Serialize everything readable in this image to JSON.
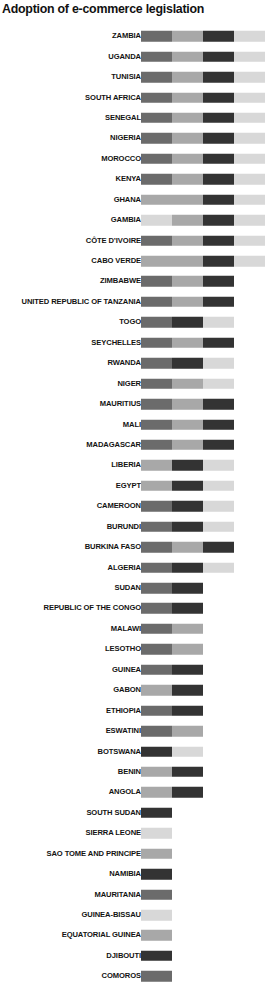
{
  "chart": {
    "title": "Adoption of e-commerce legislation"
  },
  "palette": {
    "dark": "#333333",
    "mid": "#6b6b6b",
    "light": "#a8a8a8",
    "pale": "#d8d8d8"
  },
  "chart_data": {
    "type": "bar",
    "orientation": "horizontal",
    "stacked": true,
    "title": "Adoption of e-commerce legislation",
    "xlabel": "",
    "ylabel": "",
    "grid": false,
    "legend": "none",
    "axis_ticks_visible": false,
    "xlim": [
      0,
      4
    ],
    "segment_unit_px": 31,
    "series": [
      {
        "name": "category-1",
        "color": "#6b6b6b"
      },
      {
        "name": "category-2",
        "color": "#a8a8a8"
      },
      {
        "name": "category-3",
        "color": "#333333"
      },
      {
        "name": "category-4",
        "color": "#d8d8d8"
      }
    ],
    "categories": [
      "ZAMBIA",
      "UGANDA",
      "TUNISIA",
      "SOUTH AFRICA",
      "SENEGAL",
      "NIGERIA",
      "MOROCCO",
      "KENYA",
      "GHANA",
      "GAMBIA",
      "CÔTE D’IVOIRE",
      "CABO VERDE",
      "ZIMBABWE",
      "UNITED REPUBLIC OF TANZANIA",
      "TOGO",
      "SEYCHELLES",
      "RWANDA",
      "NIGER",
      "MAURITIUS",
      "MALI",
      "MADAGASCAR",
      "LIBERIA",
      "EGYPT",
      "CAMEROON",
      "BURUNDI",
      "BURKINA FASO",
      "ALGERIA",
      "SUDAN",
      "REPUBLIC OF THE CONGO",
      "MALAWI",
      "LESOTHO",
      "GUINEA",
      "GABON",
      "ETHIOPIA",
      "ESWATINI",
      "BOTSWANA",
      "BENIN",
      "ANGOLA",
      "SOUTH SUDAN",
      "SIERRA LEONE",
      "SAO TOME AND PRINCIPE",
      "NAMIBIA",
      "MAURITANIA",
      "GUINEA-BISSAU",
      "EQUATORIAL GUINEA",
      "DJIBOUTI",
      "COMOROS"
    ],
    "rows": [
      {
        "label": "ZAMBIA",
        "segments": [
          "mid",
          "light",
          "dark",
          "pale"
        ]
      },
      {
        "label": "UGANDA",
        "segments": [
          "mid",
          "light",
          "dark",
          "pale"
        ]
      },
      {
        "label": "TUNISIA",
        "segments": [
          "mid",
          "light",
          "dark",
          "pale"
        ]
      },
      {
        "label": "SOUTH AFRICA",
        "segments": [
          "mid",
          "light",
          "dark",
          "pale"
        ]
      },
      {
        "label": "SENEGAL",
        "segments": [
          "mid",
          "light",
          "dark",
          "pale"
        ]
      },
      {
        "label": "NIGERIA",
        "segments": [
          "mid",
          "light",
          "dark",
          "pale"
        ]
      },
      {
        "label": "MOROCCO",
        "segments": [
          "mid",
          "light",
          "dark",
          "pale"
        ]
      },
      {
        "label": "KENYA",
        "segments": [
          "mid",
          "light",
          "dark",
          "pale"
        ]
      },
      {
        "label": "GHANA",
        "segments": [
          "light",
          "light",
          "dark",
          "pale"
        ]
      },
      {
        "label": "GAMBIA",
        "segments": [
          "pale",
          "light",
          "dark",
          "pale"
        ]
      },
      {
        "label": "CÔTE D’IVOIRE",
        "segments": [
          "mid",
          "light",
          "dark",
          "pale"
        ]
      },
      {
        "label": "CABO VERDE",
        "segments": [
          "light",
          "light",
          "dark",
          "pale"
        ]
      },
      {
        "label": "ZIMBABWE",
        "segments": [
          "mid",
          "light",
          "dark"
        ]
      },
      {
        "label": "UNITED REPUBLIC OF TANZANIA",
        "segments": [
          "mid",
          "light",
          "dark"
        ]
      },
      {
        "label": "TOGO",
        "segments": [
          "mid",
          "dark",
          "pale"
        ]
      },
      {
        "label": "SEYCHELLES",
        "segments": [
          "mid",
          "light",
          "dark"
        ]
      },
      {
        "label": "RWANDA",
        "segments": [
          "mid",
          "dark",
          "pale"
        ]
      },
      {
        "label": "NIGER",
        "segments": [
          "mid",
          "light",
          "pale"
        ]
      },
      {
        "label": "MAURITIUS",
        "segments": [
          "mid",
          "light",
          "dark"
        ]
      },
      {
        "label": "MALI",
        "segments": [
          "mid",
          "light",
          "dark"
        ]
      },
      {
        "label": "MADAGASCAR",
        "segments": [
          "mid",
          "light",
          "dark"
        ]
      },
      {
        "label": "LIBERIA",
        "segments": [
          "light",
          "dark",
          "pale"
        ]
      },
      {
        "label": "EGYPT",
        "segments": [
          "light",
          "dark",
          "pale"
        ]
      },
      {
        "label": "CAMEROON",
        "segments": [
          "mid",
          "dark",
          "pale"
        ]
      },
      {
        "label": "BURUNDI",
        "segments": [
          "mid",
          "dark",
          "pale"
        ]
      },
      {
        "label": "BURKINA FASO",
        "segments": [
          "mid",
          "light",
          "dark"
        ]
      },
      {
        "label": "ALGERIA",
        "segments": [
          "mid",
          "dark",
          "pale"
        ]
      },
      {
        "label": "SUDAN",
        "segments": [
          "mid",
          "dark"
        ]
      },
      {
        "label": "REPUBLIC OF THE CONGO",
        "segments": [
          "mid",
          "dark"
        ]
      },
      {
        "label": "MALAWI",
        "segments": [
          "mid",
          "light"
        ]
      },
      {
        "label": "LESOTHO",
        "segments": [
          "mid",
          "light"
        ]
      },
      {
        "label": "GUINEA",
        "segments": [
          "mid",
          "dark"
        ]
      },
      {
        "label": "GABON",
        "segments": [
          "light",
          "dark"
        ]
      },
      {
        "label": "ETHIOPIA",
        "segments": [
          "mid",
          "dark"
        ]
      },
      {
        "label": "ESWATINI",
        "segments": [
          "mid",
          "light"
        ]
      },
      {
        "label": "BOTSWANA",
        "segments": [
          "dark",
          "pale"
        ]
      },
      {
        "label": "BENIN",
        "segments": [
          "light",
          "dark"
        ]
      },
      {
        "label": "ANGOLA",
        "segments": [
          "light",
          "dark"
        ]
      },
      {
        "label": "SOUTH SUDAN",
        "segments": [
          "dark"
        ]
      },
      {
        "label": "SIERRA LEONE",
        "segments": [
          "pale"
        ]
      },
      {
        "label": "SAO TOME AND PRINCIPE",
        "segments": [
          "light"
        ]
      },
      {
        "label": "NAMIBIA",
        "segments": [
          "dark"
        ]
      },
      {
        "label": "MAURITANIA",
        "segments": [
          "mid"
        ]
      },
      {
        "label": "GUINEA-BISSAU",
        "segments": [
          "pale"
        ]
      },
      {
        "label": "EQUATORIAL GUINEA",
        "segments": [
          "light"
        ]
      },
      {
        "label": "DJIBOUTI",
        "segments": [
          "dark"
        ]
      },
      {
        "label": "COMOROS",
        "segments": [
          "mid"
        ]
      }
    ]
  }
}
